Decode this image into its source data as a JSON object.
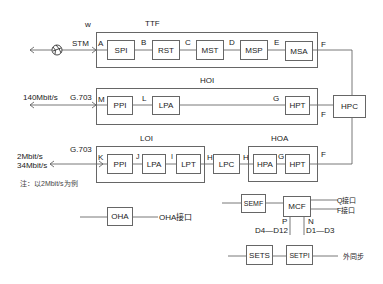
{
  "diagram": {
    "groups": {
      "ttf": "TTF",
      "hoi": "HOI",
      "loi": "LOI",
      "hoa": "HOA"
    },
    "blocks": {
      "spi": "SPI",
      "rst": "RST",
      "mst": "MST",
      "msp": "MSP",
      "msa": "MSA",
      "hoi_ppi": "PPI",
      "hoi_lpa": "LPA",
      "hoi_hpt": "HPT",
      "hpc": "HPC",
      "loi_ppi": "PPI",
      "loi_lpa": "LPA",
      "loi_lpt": "LPT",
      "lpc": "LPC",
      "hpa": "HPA",
      "hoa_hpt": "HPT",
      "oha": "OHA",
      "semf": "SEMF",
      "mcf": "MCF",
      "sets": "SETS",
      "setpi": "SETPI"
    },
    "ref_points": {
      "w": "w",
      "a": "A",
      "b": "B",
      "c": "C",
      "d": "D",
      "e": "E",
      "f_ttf": "F",
      "m": "M",
      "l": "L",
      "g_hoi": "G",
      "f_hoi": "F",
      "k": "K",
      "j": "J",
      "i": "I",
      "h1": "H",
      "h2": "H",
      "g_hoa": "G",
      "f_hoa": "F",
      "p": "P",
      "n": "N"
    },
    "interfaces": {
      "stm": "STM",
      "rate_140": "140Mbit/s",
      "g703_hoi": "G.703",
      "rate_2": "2Mbit/s",
      "rate_34": "34Mbit/s",
      "g703_loi": "G.703",
      "note": "注：以2Mbit/s为例",
      "oha_port": "OHA接口",
      "q_port": "Q接口",
      "f_port": "F接口",
      "d4_d12": "D4—D12",
      "d1_d3": "D1—D3",
      "ext_sync": "外同步"
    }
  }
}
